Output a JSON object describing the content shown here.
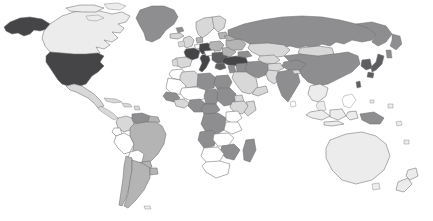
{
  "figure": {
    "type": "choropleth-world-map",
    "title": "",
    "background_color": "#ffffff",
    "width": 433,
    "height": 221,
    "projection": "equirectangular",
    "border_color": "#6e6e6e",
    "border_width": 0.55
  },
  "legend": {
    "visible": false,
    "shade_levels": [
      {
        "key": "none",
        "color": "#ffffff",
        "label": "No data"
      },
      {
        "key": "very_light",
        "color": "#ececed",
        "label": "Very low"
      },
      {
        "key": "light",
        "color": "#d8d8d9",
        "label": "Low"
      },
      {
        "key": "medium",
        "color": "#b4b4b5",
        "label": "Medium"
      },
      {
        "key": "dark",
        "color": "#8e8e90",
        "label": "High"
      },
      {
        "key": "very_dark",
        "color": "#5e5e61",
        "label": "Very high"
      },
      {
        "key": "darkest",
        "color": "#454548",
        "label": "Highest"
      }
    ]
  },
  "chart_data": {
    "type": "map",
    "title": "",
    "subtitle": "",
    "xlabel": "",
    "ylabel": "",
    "value_scale": "ordinal-gray-shading",
    "regions": [
      {
        "name": "Alaska",
        "shade": "darkest"
      },
      {
        "name": "Canada",
        "shade": "very_light"
      },
      {
        "name": "Greenland",
        "shade": "dark"
      },
      {
        "name": "United States",
        "shade": "darkest"
      },
      {
        "name": "Mexico",
        "shade": "light"
      },
      {
        "name": "Cuba",
        "shade": "light"
      },
      {
        "name": "Central America",
        "shade": "light"
      },
      {
        "name": "Colombia",
        "shade": "light"
      },
      {
        "name": "Venezuela",
        "shade": "dark"
      },
      {
        "name": "Guyanas",
        "shade": "medium"
      },
      {
        "name": "Brazil",
        "shade": "medium"
      },
      {
        "name": "Peru",
        "shade": "none"
      },
      {
        "name": "Bolivia",
        "shade": "none"
      },
      {
        "name": "Chile",
        "shade": "medium"
      },
      {
        "name": "Argentina",
        "shade": "medium"
      },
      {
        "name": "Iceland",
        "shade": "light"
      },
      {
        "name": "United Kingdom",
        "shade": "light"
      },
      {
        "name": "Ireland",
        "shade": "light"
      },
      {
        "name": "Scandinavia",
        "shade": "light"
      },
      {
        "name": "France",
        "shade": "darkest"
      },
      {
        "name": "Spain",
        "shade": "light"
      },
      {
        "name": "Portugal",
        "shade": "light"
      },
      {
        "name": "Germany",
        "shade": "darkest"
      },
      {
        "name": "Italy",
        "shade": "darkest"
      },
      {
        "name": "Poland",
        "shade": "medium"
      },
      {
        "name": "Balkans",
        "shade": "very_dark"
      },
      {
        "name": "Greece",
        "shade": "very_dark"
      },
      {
        "name": "Turkey",
        "shade": "darkest"
      },
      {
        "name": "Ukraine",
        "shade": "medium"
      },
      {
        "name": "Russia",
        "shade": "dark"
      },
      {
        "name": "Kazakhstan",
        "shade": "light"
      },
      {
        "name": "Mongolia",
        "shade": "light"
      },
      {
        "name": "China",
        "shade": "dark"
      },
      {
        "name": "Japan",
        "shade": "very_dark"
      },
      {
        "name": "Korea",
        "shade": "very_dark"
      },
      {
        "name": "India",
        "shade": "dark"
      },
      {
        "name": "Pakistan",
        "shade": "light"
      },
      {
        "name": "Iran",
        "shade": "dark"
      },
      {
        "name": "Iraq",
        "shade": "dark"
      },
      {
        "name": "Saudi Arabia",
        "shade": "light"
      },
      {
        "name": "Morocco",
        "shade": "none"
      },
      {
        "name": "Algeria",
        "shade": "light"
      },
      {
        "name": "Libya",
        "shade": "dark"
      },
      {
        "name": "Egypt",
        "shade": "dark"
      },
      {
        "name": "Mali",
        "shade": "none"
      },
      {
        "name": "Niger",
        "shade": "none"
      },
      {
        "name": "Chad",
        "shade": "dark"
      },
      {
        "name": "Sudan",
        "shade": "dark"
      },
      {
        "name": "Nigeria",
        "shade": "dark"
      },
      {
        "name": "Ethiopia",
        "shade": "light"
      },
      {
        "name": "Kenya",
        "shade": "none"
      },
      {
        "name": "DR Congo",
        "shade": "dark"
      },
      {
        "name": "Angola",
        "shade": "dark"
      },
      {
        "name": "Tanzania",
        "shade": "none"
      },
      {
        "name": "Zambia",
        "shade": "none"
      },
      {
        "name": "South Africa",
        "shade": "none"
      },
      {
        "name": "Madagascar",
        "shade": "dark"
      },
      {
        "name": "Indonesia",
        "shade": "none"
      },
      {
        "name": "Philippines",
        "shade": "none"
      },
      {
        "name": "Papua New Guinea",
        "shade": "dark"
      },
      {
        "name": "Australia",
        "shade": "very_light"
      },
      {
        "name": "New Zealand",
        "shade": "very_light"
      }
    ]
  }
}
